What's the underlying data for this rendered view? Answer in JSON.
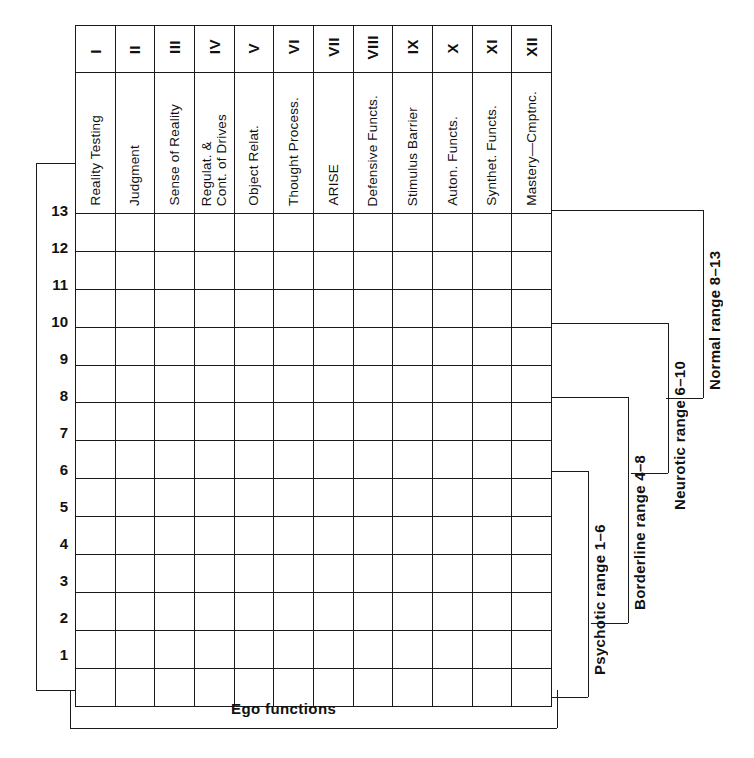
{
  "figure": {
    "bottom_axis_label": "Ego  functions",
    "scale_values": [
      "13",
      "12",
      "11",
      "10",
      "9",
      "8",
      "7",
      "6",
      "5",
      "4",
      "3",
      "2",
      "1"
    ],
    "ink_color": "#1a1a1a",
    "background_color": "#ffffff"
  },
  "columns": [
    {
      "roman": "I",
      "name": "Reality Testing"
    },
    {
      "roman": "II",
      "name": "Judgment"
    },
    {
      "roman": "III",
      "name": "Sense of Reality"
    },
    {
      "roman": "IV",
      "name": "Regulat. &\nCont. of Drives"
    },
    {
      "roman": "V",
      "name": "Object Relat."
    },
    {
      "roman": "VI",
      "name": "Thought Process."
    },
    {
      "roman": "VII",
      "name": "ARISE"
    },
    {
      "roman": "VIII",
      "name": "Defensive Functs."
    },
    {
      "roman": "IX",
      "name": "Stimulus Barrier"
    },
    {
      "roman": "X",
      "name": "Auton. Functs."
    },
    {
      "roman": "XI",
      "name": "Synthet. Functs."
    },
    {
      "roman": "XII",
      "name": "Mastery—Cmptnc."
    }
  ],
  "ranges": [
    {
      "label": "Psychotic range 1–6",
      "from": 1,
      "to": 6
    },
    {
      "label": "Borderline range 4–8",
      "from": 4,
      "to": 8
    },
    {
      "label": "Neurotic range 6–10",
      "from": 6,
      "to": 10
    },
    {
      "label": "Normal range 8–13",
      "from": 8,
      "to": 13
    }
  ]
}
